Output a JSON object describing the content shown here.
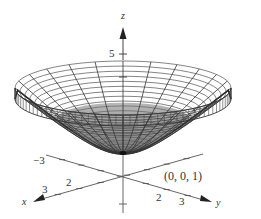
{
  "chart_data": {
    "type": "surface3d",
    "title": "",
    "surface": {
      "vertex": [
        0,
        0,
        1
      ],
      "z_top": 5,
      "radial_lines": 24,
      "level_rings": 22
    },
    "axes": {
      "x": {
        "label": "x",
        "ticks": [
          {
            "value": 3,
            "label": "3"
          },
          {
            "value": 2,
            "label": "2"
          }
        ]
      },
      "y": {
        "label": "y",
        "ticks": [
          {
            "value": -3,
            "label": "−3"
          },
          {
            "value": 2,
            "label": "2"
          },
          {
            "value": 3,
            "label": "3"
          }
        ]
      },
      "z": {
        "label": "z",
        "ticks": [
          {
            "value": 5,
            "label": "5"
          }
        ]
      }
    },
    "annotations": [
      {
        "text": "(0, 0, 1)",
        "point": [
          0,
          0,
          1
        ]
      }
    ],
    "colors": {
      "mesh_line": "#333333",
      "inner_shade": "#9a9a9a",
      "axis": "#555555",
      "background": "#ffffff"
    }
  },
  "labels": {
    "z_axis": "z",
    "x_axis": "x",
    "y_axis": "y",
    "z_tick_5": "5",
    "x_tick_3": "3",
    "x_tick_2": "2",
    "y_tick_neg3": "−3",
    "y_tick_2": "2",
    "y_tick_3": "3",
    "vertex_point": "(0, 0, 1)"
  }
}
